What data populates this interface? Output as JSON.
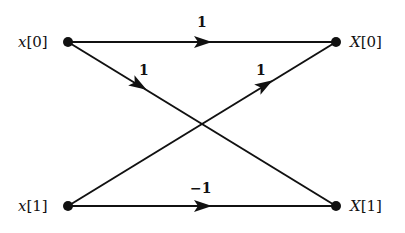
{
  "diagram": {
    "type": "butterfly-flow-graph",
    "nodes": [
      {
        "id": "x0",
        "var": "x",
        "index": "[0]",
        "x": 68,
        "y": 42,
        "side": "left"
      },
      {
        "id": "x1",
        "var": "x",
        "index": "[1]",
        "x": 68,
        "y": 206,
        "side": "left"
      },
      {
        "id": "X0",
        "var": "X",
        "index": "[0]",
        "x": 336,
        "y": 42,
        "side": "right"
      },
      {
        "id": "X1",
        "var": "X",
        "index": "[1]",
        "x": 336,
        "y": 206,
        "side": "right"
      }
    ],
    "edges": [
      {
        "from": "x0",
        "to": "X0",
        "label": "1"
      },
      {
        "from": "x0",
        "to": "X1",
        "label": "1"
      },
      {
        "from": "x1",
        "to": "X0",
        "label": "1"
      },
      {
        "from": "x1",
        "to": "X1",
        "label": "−1"
      }
    ]
  }
}
